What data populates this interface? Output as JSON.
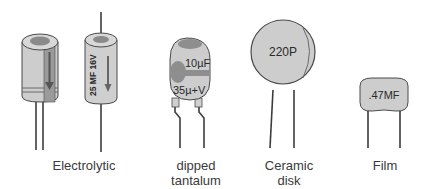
{
  "components": [
    {
      "id": "electrolytic",
      "label": "Electrolytic",
      "items": [
        {
          "type": "radial-can",
          "marking": ""
        },
        {
          "type": "axial-can",
          "marking": "25 MF 16V"
        }
      ]
    },
    {
      "id": "dipped-tantalum",
      "label_lines": [
        "dipped",
        "tantalum"
      ],
      "marking_top": "10µF",
      "marking_bottom": "35µ+V"
    },
    {
      "id": "ceramic-disk",
      "label_lines": [
        "Ceramic",
        "disk"
      ],
      "marking": "220P"
    },
    {
      "id": "film",
      "label": "Film",
      "marking": ".47MF"
    }
  ],
  "colors": {
    "body_fill": "#cdcdcd",
    "body_dark": "#8a8a8a",
    "outline": "#4a4a4a",
    "lead": "#3c3c3c",
    "text": "#3a3a3a"
  }
}
